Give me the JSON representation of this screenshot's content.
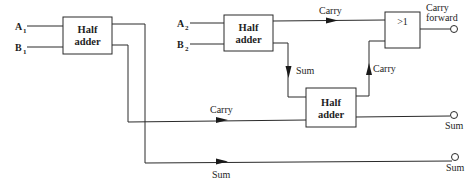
{
  "diagram": {
    "type": "full adder from half adders (block diagram)",
    "inputs": [
      {
        "name": "A",
        "subscript": "1"
      },
      {
        "name": "B",
        "subscript": "1"
      },
      {
        "name": "A",
        "subscript": "2"
      },
      {
        "name": "B",
        "subscript": "2"
      }
    ],
    "blocks": {
      "half_adder_1": {
        "line1": "Half",
        "line2": "adder"
      },
      "half_adder_2": {
        "line1": "Half",
        "line2": "adder"
      },
      "half_adder_3": {
        "line1": "Half",
        "line2": "adder"
      },
      "or_gate": {
        "label": ">1"
      }
    },
    "signal_labels": {
      "ha2_carry": "Carry",
      "ha2_sum": "Sum",
      "ha3_carry": "Carry",
      "ha1_carry": "Carry",
      "ha1_sum": "Sum"
    },
    "outputs": {
      "carry_forward_line1": "Carry",
      "carry_forward_line2": "forward",
      "sum_upper": "Sum",
      "sum_lower": "Sum"
    },
    "colors": {
      "line": "#2a2a2a",
      "background": "#ffffff"
    }
  }
}
